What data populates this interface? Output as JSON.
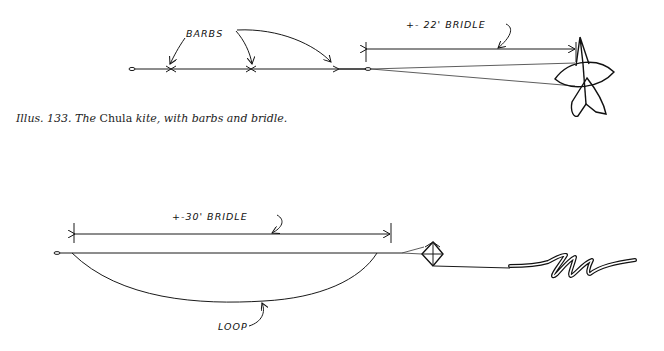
{
  "figure1": {
    "labels": {
      "barbs": "BARBS",
      "bridle": "+- 22' BRIDLE"
    },
    "caption": {
      "prefix": "Illus. 133. The ",
      "name": "Chula",
      "suffix": " kite, with barbs and bridle."
    }
  },
  "figure2": {
    "labels": {
      "bridle": "+-30' BRIDLE",
      "loop": "LOOP"
    }
  }
}
